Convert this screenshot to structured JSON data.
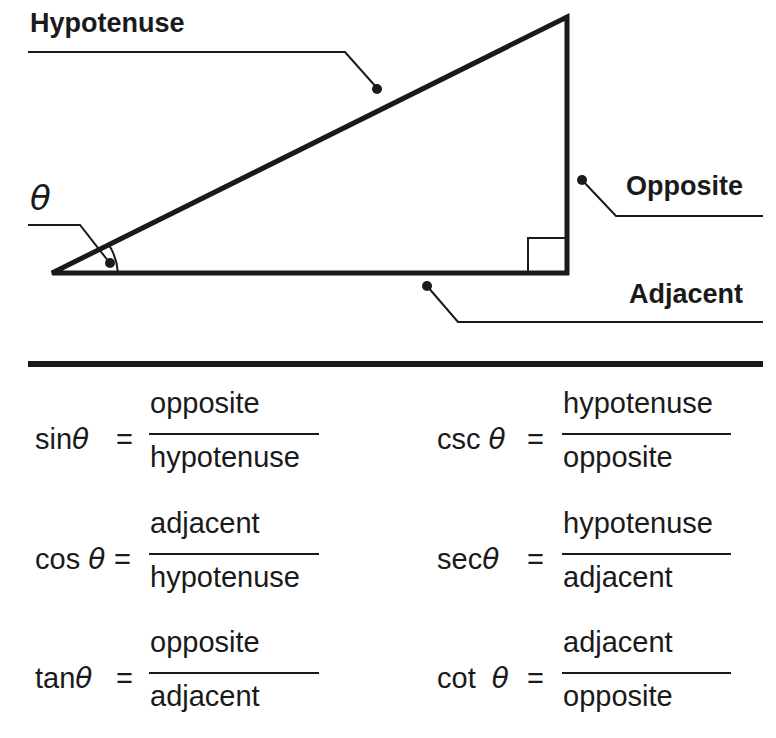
{
  "diagram": {
    "labels": {
      "hypotenuse": "Hypotenuse",
      "opposite": "Opposite",
      "adjacent": "Adjacent",
      "angle": "θ"
    }
  },
  "formulas": [
    {
      "fn": "sin",
      "theta": "θ",
      "eq": "=",
      "numerator": "opposite",
      "denominator": "hypotenuse"
    },
    {
      "fn": "cos",
      "theta": "θ",
      "eq": "=",
      "numerator": "adjacent",
      "denominator": "hypotenuse"
    },
    {
      "fn": "tan",
      "theta": "θ",
      "eq": "=",
      "numerator": "opposite",
      "denominator": "adjacent"
    },
    {
      "fn": "csc",
      "theta": "θ",
      "eq": "=",
      "numerator": "hypotenuse",
      "denominator": "opposite"
    },
    {
      "fn": "sec",
      "theta": "θ",
      "eq": "=",
      "numerator": "hypotenuse",
      "denominator": "adjacent"
    },
    {
      "fn": "cot",
      "theta": "θ",
      "eq": "=",
      "numerator": "adjacent",
      "denominator": "opposite"
    }
  ]
}
